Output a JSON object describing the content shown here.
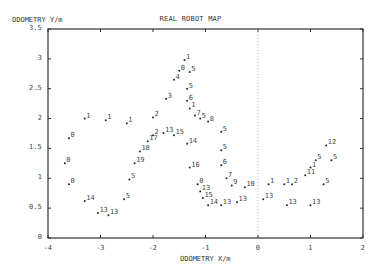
{
  "chart_data": {
    "type": "scatter",
    "title": "REAL ROBOT MAP",
    "xlabel": "ODOMETRY X/m",
    "ylabel": "ODOMETRY Y/m",
    "xlim": [
      -4,
      2
    ],
    "ylim": [
      0,
      3.5
    ],
    "x_ticks": [
      "-4",
      "-3",
      "-2",
      "-1",
      "0",
      "1",
      "2"
    ],
    "y_ticks": [
      "0",
      "0.5",
      "1",
      "1.5",
      "2",
      "2.5",
      "3",
      "3.5"
    ],
    "grid": false,
    "vertical_reference_line_x": 0,
    "points": [
      {
        "x": -3.6,
        "y": 1.67,
        "label": "0"
      },
      {
        "x": -3.68,
        "y": 1.25,
        "label": "0"
      },
      {
        "x": -3.6,
        "y": 0.9,
        "label": "0"
      },
      {
        "x": -3.3,
        "y": 0.62,
        "label": "14"
      },
      {
        "x": -3.05,
        "y": 0.42,
        "label": "13"
      },
      {
        "x": -2.85,
        "y": 0.38,
        "label": "13"
      },
      {
        "x": -2.55,
        "y": 0.65,
        "label": "5"
      },
      {
        "x": -2.45,
        "y": 0.98,
        "label": "5"
      },
      {
        "x": -2.35,
        "y": 1.25,
        "label": "19"
      },
      {
        "x": -2.25,
        "y": 1.45,
        "label": "18"
      },
      {
        "x": -2.1,
        "y": 1.62,
        "label": "17"
      },
      {
        "x": -2.0,
        "y": 1.72,
        "label": "2"
      },
      {
        "x": -1.8,
        "y": 1.76,
        "label": "13"
      },
      {
        "x": -1.6,
        "y": 1.72,
        "label": "15"
      },
      {
        "x": -3.3,
        "y": 2.0,
        "label": "1"
      },
      {
        "x": -2.9,
        "y": 1.97,
        "label": "1"
      },
      {
        "x": -2.5,
        "y": 1.92,
        "label": "1"
      },
      {
        "x": -2.0,
        "y": 2.02,
        "label": "2"
      },
      {
        "x": -1.75,
        "y": 2.33,
        "label": "3"
      },
      {
        "x": -1.6,
        "y": 2.65,
        "label": "4"
      },
      {
        "x": -1.5,
        "y": 2.8,
        "label": "0"
      },
      {
        "x": -1.4,
        "y": 2.98,
        "label": "1"
      },
      {
        "x": -1.3,
        "y": 2.78,
        "label": "5"
      },
      {
        "x": -1.35,
        "y": 2.5,
        "label": "5"
      },
      {
        "x": -1.35,
        "y": 2.3,
        "label": "6"
      },
      {
        "x": -1.3,
        "y": 2.17,
        "label": "1"
      },
      {
        "x": -1.2,
        "y": 2.05,
        "label": "7"
      },
      {
        "x": -1.1,
        "y": 2.0,
        "label": "5"
      },
      {
        "x": -0.95,
        "y": 1.95,
        "label": "8"
      },
      {
        "x": -1.35,
        "y": 1.58,
        "label": "14"
      },
      {
        "x": -0.7,
        "y": 1.78,
        "label": "5"
      },
      {
        "x": -0.7,
        "y": 1.47,
        "label": "5"
      },
      {
        "x": -0.7,
        "y": 1.22,
        "label": "6"
      },
      {
        "x": -1.3,
        "y": 1.18,
        "label": "16"
      },
      {
        "x": -0.6,
        "y": 1.0,
        "label": "7"
      },
      {
        "x": -0.5,
        "y": 0.88,
        "label": "9"
      },
      {
        "x": -0.25,
        "y": 0.85,
        "label": "10"
      },
      {
        "x": -1.15,
        "y": 0.9,
        "label": "0"
      },
      {
        "x": -1.1,
        "y": 0.78,
        "label": "13"
      },
      {
        "x": -1.05,
        "y": 0.67,
        "label": "15"
      },
      {
        "x": -0.95,
        "y": 0.55,
        "label": "14"
      },
      {
        "x": -0.7,
        "y": 0.55,
        "label": "13"
      },
      {
        "x": -0.4,
        "y": 0.6,
        "label": "13"
      },
      {
        "x": 0.1,
        "y": 0.65,
        "label": "13"
      },
      {
        "x": 0.2,
        "y": 0.9,
        "label": "1"
      },
      {
        "x": 0.5,
        "y": 0.9,
        "label": "1"
      },
      {
        "x": 0.65,
        "y": 0.9,
        "label": "2"
      },
      {
        "x": 0.9,
        "y": 1.05,
        "label": "11"
      },
      {
        "x": 1.0,
        "y": 1.18,
        "label": "1"
      },
      {
        "x": 1.1,
        "y": 1.3,
        "label": "5"
      },
      {
        "x": 1.3,
        "y": 1.55,
        "label": "12"
      },
      {
        "x": 1.4,
        "y": 1.3,
        "label": "5"
      },
      {
        "x": 1.25,
        "y": 0.9,
        "label": "5"
      },
      {
        "x": 0.55,
        "y": 0.55,
        "label": "13"
      },
      {
        "x": 1.0,
        "y": 0.55,
        "label": "13"
      }
    ]
  }
}
